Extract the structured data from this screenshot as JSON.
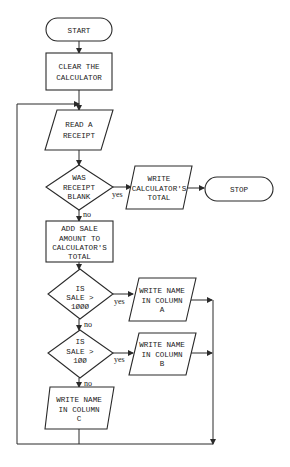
{
  "diagram": {
    "type": "flowchart",
    "nodes": {
      "start": {
        "kind": "terminal",
        "lines": [
          "START"
        ]
      },
      "clear": {
        "kind": "process",
        "lines": [
          "CLEAR THE",
          "CALCULATOR"
        ]
      },
      "read": {
        "kind": "io",
        "lines": [
          "READ A",
          "RECEIPT"
        ]
      },
      "blank": {
        "kind": "decision",
        "lines": [
          "WAS",
          "RECEIPT",
          "BLANK"
        ]
      },
      "write_total": {
        "kind": "io",
        "lines": [
          "WRITE",
          "CALCULATOR'S",
          "TOTAL"
        ]
      },
      "stop": {
        "kind": "terminal",
        "lines": [
          "STOP"
        ]
      },
      "add": {
        "kind": "process",
        "lines": [
          "ADD SALE",
          "AMOUNT TO",
          "CALCULATOR'S",
          "TOTAL"
        ]
      },
      "gt1000": {
        "kind": "decision",
        "lines": [
          "IS",
          "SALE >",
          "1ØØØ"
        ]
      },
      "write_a": {
        "kind": "io",
        "lines": [
          "WRITE NAME",
          "IN COLUMN",
          "A"
        ]
      },
      "gt100": {
        "kind": "decision",
        "lines": [
          "IS",
          "SALE >",
          "1ØØ"
        ]
      },
      "write_b": {
        "kind": "io",
        "lines": [
          "WRITE NAME",
          "IN COLUMN",
          "B"
        ]
      },
      "write_c": {
        "kind": "io",
        "lines": [
          "WRITE NAME",
          "IN COLUMN",
          "C"
        ]
      }
    },
    "edge_labels": {
      "yes": "yes",
      "no": "no"
    },
    "edges": [
      {
        "from": "start",
        "to": "clear"
      },
      {
        "from": "clear",
        "to": "read"
      },
      {
        "from": "read",
        "to": "blank"
      },
      {
        "from": "blank",
        "to": "write_total",
        "label": "yes"
      },
      {
        "from": "write_total",
        "to": "stop"
      },
      {
        "from": "blank",
        "to": "add",
        "label": "no"
      },
      {
        "from": "add",
        "to": "gt1000"
      },
      {
        "from": "gt1000",
        "to": "write_a",
        "label": "yes"
      },
      {
        "from": "gt1000",
        "to": "gt100",
        "label": "no"
      },
      {
        "from": "gt100",
        "to": "write_b",
        "label": "yes"
      },
      {
        "from": "gt100",
        "to": "write_c",
        "label": "no"
      },
      {
        "from": "write_a",
        "to": "read"
      },
      {
        "from": "write_b",
        "to": "read"
      },
      {
        "from": "write_c",
        "to": "read"
      }
    ]
  }
}
